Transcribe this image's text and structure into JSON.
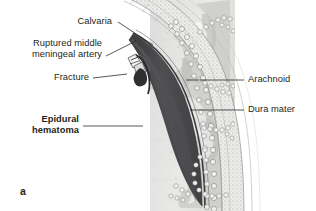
{
  "figure": {
    "letter": "a",
    "background_color": "#ffffff",
    "text_color": "#231f20"
  },
  "labels": {
    "calvaria": "Calvaria",
    "ruptured_artery_line1": "Ruptured middle",
    "ruptured_artery_line2": "meningeal artery",
    "fracture": "Fracture",
    "epidural_line1": "Epidural",
    "epidural_line2": "hematoma",
    "arachnoid": "Arachnoid",
    "dura_mater": "Dura mater"
  },
  "colors": {
    "hematoma": "#4a4a4d",
    "hematoma_dark": "#3b3b3e",
    "bone_outer": "#d9d9d6",
    "bone_diploe": "#e8e8e4",
    "brain_light": "#e3e3e0",
    "brain_mid": "#cfcfcc",
    "arachnoid": "#bdbdba",
    "leader_line": "#231f20",
    "outline": "#5a5a5a"
  },
  "leader_lines": [
    {
      "name": "calvaria-leader",
      "x1": 118,
      "y1": 22,
      "x2": 153,
      "y2": 45
    },
    {
      "name": "artery-leader",
      "x1": 106,
      "y1": 56,
      "x2": 136,
      "y2": 41
    },
    {
      "name": "fracture-leader",
      "x1": 93,
      "y1": 78,
      "x2": 127,
      "y2": 74
    },
    {
      "name": "hematoma-leader",
      "x1": 83,
      "y1": 126,
      "x2": 143,
      "y2": 126
    },
    {
      "name": "arachnoid-leader",
      "x1": 186,
      "y1": 80,
      "x2": 244,
      "y2": 80
    },
    {
      "name": "dura-leader",
      "x1": 190,
      "y1": 110,
      "x2": 244,
      "y2": 110
    }
  ]
}
